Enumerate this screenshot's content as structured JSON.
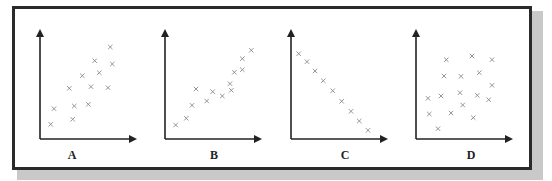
{
  "figure": {
    "type": "four scatter plots with arrowed axes",
    "colors": {
      "frame": "#2a2a2a",
      "shadow": "#c9c9c9",
      "axis": "#222222",
      "marker": "#8a8a8a"
    },
    "marker_glyph": "×"
  },
  "panels": [
    {
      "label": "A",
      "description": "moderate positive correlation",
      "axis_origin": [
        40,
        139
      ],
      "points": [
        [
          50.7,
          124.3
        ],
        [
          54,
          108.7
        ],
        [
          72.7,
          119.3
        ],
        [
          74.3,
          106
        ],
        [
          88.3,
          104.3
        ],
        [
          69.3,
          88.3
        ],
        [
          82.3,
          75.7
        ],
        [
          91,
          86.7
        ],
        [
          99.3,
          72.7
        ],
        [
          94.7,
          60.7
        ],
        [
          108,
          87.7
        ],
        [
          112.3,
          64
        ],
        [
          110.3,
          47
        ]
      ]
    },
    {
      "label": "B",
      "description": "strong positive correlation",
      "axis_origin": [
        165,
        139
      ],
      "points": [
        [
          175.7,
          125
        ],
        [
          186.3,
          118.3
        ],
        [
          192,
          105.3
        ],
        [
          196,
          89
        ],
        [
          206.7,
          101
        ],
        [
          212.7,
          91.7
        ],
        [
          222.3,
          96
        ],
        [
          230,
          83.7
        ],
        [
          231.3,
          90.3
        ],
        [
          234.3,
          72.3
        ],
        [
          242.3,
          69.7
        ],
        [
          242.3,
          58.7
        ],
        [
          251.3,
          50.3
        ]
      ]
    },
    {
      "label": "C",
      "description": "perfect negative correlation",
      "axis_origin": [
        291,
        139
      ],
      "points": [
        [
          298.7,
          53.7
        ],
        [
          307,
          61.7
        ],
        [
          315,
          71
        ],
        [
          323.3,
          80.7
        ],
        [
          332.7,
          90.7
        ],
        [
          341.7,
          101.3
        ],
        [
          351,
          111.3
        ],
        [
          359.3,
          121
        ],
        [
          368,
          130.3
        ]
      ]
    },
    {
      "label": "D",
      "description": "no correlation",
      "axis_origin": [
        416,
        139
      ],
      "points": [
        [
          446.3,
          59.7
        ],
        [
          472,
          56
        ],
        [
          492,
          59.7
        ],
        [
          444,
          76
        ],
        [
          461,
          76.3
        ],
        [
          479.3,
          72.7
        ],
        [
          492,
          85.3
        ],
        [
          428,
          98.3
        ],
        [
          441,
          96
        ],
        [
          460,
          92.7
        ],
        [
          477.3,
          95.3
        ],
        [
          488.7,
          99.7
        ],
        [
          462.7,
          105
        ],
        [
          429.3,
          114
        ],
        [
          451,
          113
        ],
        [
          473.3,
          117.7
        ],
        [
          438,
          128.7
        ]
      ]
    }
  ],
  "chart_data": [
    {
      "type": "scatter",
      "title": "A",
      "xlabel": "",
      "ylabel": "",
      "grid": false,
      "x": [
        0.11,
        0.15,
        0.34,
        0.35,
        0.5,
        0.3,
        0.44,
        0.53,
        0.61,
        0.56,
        0.7,
        0.75,
        0.73
      ],
      "y": [
        0.13,
        0.27,
        0.18,
        0.3,
        0.31,
        0.46,
        0.57,
        0.47,
        0.6,
        0.71,
        0.47,
        0.68,
        0.84
      ]
    },
    {
      "type": "scatter",
      "title": "B",
      "xlabel": "",
      "ylabel": "",
      "grid": false,
      "x": [
        0.11,
        0.22,
        0.28,
        0.32,
        0.43,
        0.49,
        0.59,
        0.67,
        0.68,
        0.71,
        0.79,
        0.79,
        0.88
      ],
      "y": [
        0.13,
        0.19,
        0.3,
        0.45,
        0.34,
        0.43,
        0.39,
        0.5,
        0.44,
        0.6,
        0.63,
        0.72,
        0.8
      ]
    },
    {
      "type": "scatter",
      "title": "C",
      "xlabel": "",
      "ylabel": "",
      "grid": false,
      "x": [
        0.08,
        0.16,
        0.24,
        0.33,
        0.42,
        0.51,
        0.61,
        0.69,
        0.78
      ],
      "y": [
        0.77,
        0.7,
        0.61,
        0.53,
        0.44,
        0.34,
        0.25,
        0.16,
        0.08
      ]
    },
    {
      "type": "scatter",
      "title": "D",
      "xlabel": "",
      "ylabel": "",
      "grid": false,
      "x": [
        0.31,
        0.57,
        0.77,
        0.29,
        0.46,
        0.64,
        0.77,
        0.13,
        0.26,
        0.45,
        0.62,
        0.73,
        0.48,
        0.14,
        0.36,
        0.58,
        0.23
      ],
      "y": [
        0.71,
        0.75,
        0.71,
        0.57,
        0.56,
        0.6,
        0.48,
        0.37,
        0.39,
        0.42,
        0.4,
        0.36,
        0.31,
        0.23,
        0.24,
        0.19,
        0.09
      ]
    }
  ]
}
